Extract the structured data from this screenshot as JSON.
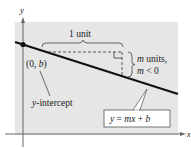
{
  "figure": {
    "background_color": "#e8e8e8",
    "axes": {
      "x_label": "x",
      "y_label": "y"
    },
    "point_label": "(0, b)",
    "intercept_label": "y-intercept",
    "run_label": "1 unit",
    "rise_label_line1": "m units,",
    "rise_label_line2": "m < 0",
    "equation_label": "y = mx + b"
  }
}
